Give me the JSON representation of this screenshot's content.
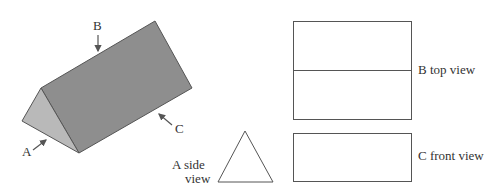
{
  "diagram": {
    "labels": {
      "B": "B",
      "A": "A",
      "C": "C"
    },
    "views": {
      "top": "B top view",
      "front": "C front view",
      "side_line1": "A side",
      "side_line2": "view"
    },
    "colors": {
      "prism_long_face": "#8e8e8e",
      "prism_end_face": "#b9b9b9",
      "outline": "#555555"
    }
  }
}
